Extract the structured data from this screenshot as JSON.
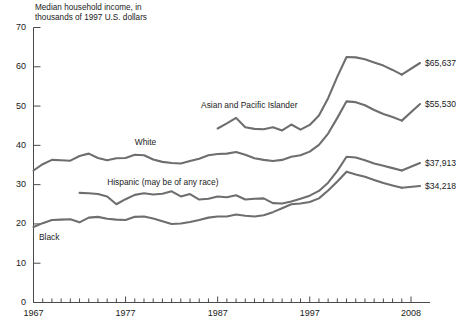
{
  "chart_data": {
    "type": "line",
    "title": "Median household income, in\nthousands of 1997 U.S. dollars",
    "xlabel": "",
    "ylabel": "",
    "xlim": [
      1967,
      2008
    ],
    "ylim": [
      0,
      70
    ],
    "yticks": [
      0,
      10,
      20,
      30,
      40,
      50,
      60,
      70
    ],
    "xticks_labeled": [
      1967,
      1977,
      1987,
      1997,
      2008
    ],
    "xtick_step": 1,
    "grid": false,
    "legend": "inline-labels",
    "x": [
      1967,
      1968,
      1969,
      1970,
      1971,
      1972,
      1973,
      1974,
      1975,
      1976,
      1977,
      1978,
      1979,
      1980,
      1981,
      1982,
      1983,
      1984,
      1985,
      1986,
      1987,
      1988,
      1989,
      1990,
      1991,
      1992,
      1993,
      1994,
      1995,
      1996,
      1997,
      1998,
      1999,
      2000,
      2001,
      2002,
      2003,
      2004,
      2005,
      2006,
      2007,
      2008
    ],
    "series": [
      {
        "name": "Asian and Pacific Islander",
        "label_x": 1987.2,
        "end_label": "$65,637",
        "x": [
          1987,
          1988,
          1989,
          1990,
          1991,
          1992,
          1993,
          1994,
          1995,
          1996,
          1997,
          1998,
          1999,
          2000,
          2001,
          2002,
          2003,
          2004,
          2005,
          2006,
          2007,
          2008
        ],
        "values": [
          44.3,
          45.6,
          47.0,
          44.6,
          44.2,
          44.1,
          44.6,
          43.8,
          45.3,
          44.0,
          45.2,
          47.6,
          52.0,
          57.5,
          62.5,
          62.4,
          61.9,
          61.1,
          60.3,
          59.2,
          58.0,
          65.637
        ]
      },
      {
        "name": "White",
        "label_x": 1978.5,
        "end_label": "$55,530",
        "x": [
          1967,
          1968,
          1969,
          1970,
          1971,
          1972,
          1973,
          1974,
          1975,
          1976,
          1977,
          1978,
          1979,
          1980,
          1981,
          1982,
          1983,
          1984,
          1985,
          1986,
          1987,
          1988,
          1989,
          1990,
          1991,
          1992,
          1993,
          1994,
          1995,
          1996,
          1997,
          1998,
          1999,
          2000,
          2001,
          2002,
          2003,
          2004,
          2005,
          2006,
          2007,
          2008
        ],
        "values": [
          33.6,
          35.2,
          36.3,
          36.2,
          36.1,
          37.3,
          37.9,
          36.8,
          36.2,
          36.7,
          36.8,
          37.6,
          37.5,
          36.4,
          35.8,
          35.5,
          35.4,
          36.0,
          36.6,
          37.5,
          37.8,
          37.9,
          38.3,
          37.6,
          36.7,
          36.3,
          36.0,
          36.3,
          37.1,
          37.5,
          38.4,
          40.1,
          43.0,
          47.0,
          51.2,
          51.0,
          50.2,
          49.0,
          48.0,
          47.2,
          46.3,
          55.53
        ]
      },
      {
        "name": "Hispanic (may be of any race)",
        "label_x": 1976.5,
        "end_label": "$37,913",
        "x": [
          1972,
          1973,
          1974,
          1975,
          1976,
          1977,
          1978,
          1979,
          1980,
          1981,
          1982,
          1983,
          1984,
          1985,
          1986,
          1987,
          1988,
          1989,
          1990,
          1991,
          1992,
          1993,
          1994,
          1995,
          1996,
          1997,
          1998,
          1999,
          2000,
          2001,
          2002,
          2003,
          2004,
          2005,
          2006,
          2007,
          2008
        ],
        "values": [
          27.9,
          27.8,
          27.6,
          27.0,
          25.0,
          26.3,
          27.4,
          27.8,
          27.5,
          27.7,
          28.3,
          27.0,
          27.6,
          26.2,
          26.4,
          27.0,
          26.8,
          27.3,
          26.2,
          26.4,
          26.5,
          25.3,
          25.2,
          25.7,
          26.4,
          27.2,
          28.4,
          30.5,
          33.5,
          37.1,
          36.9,
          36.2,
          35.4,
          34.8,
          34.2,
          33.6,
          37.913
        ]
      },
      {
        "name": "Black",
        "label_x": 1968.0,
        "end_label": "$34,218",
        "x": [
          1967,
          1968,
          1969,
          1970,
          1971,
          1972,
          1973,
          1974,
          1975,
          1976,
          1977,
          1978,
          1979,
          1980,
          1981,
          1982,
          1983,
          1984,
          1985,
          1986,
          1987,
          1988,
          1989,
          1990,
          1991,
          1992,
          1993,
          1994,
          1995,
          1996,
          1997,
          1998,
          1999,
          2000,
          2001,
          2002,
          2003,
          2004,
          2005,
          2006,
          2007,
          2008
        ],
        "values": [
          19.2,
          20.2,
          21.0,
          21.1,
          21.2,
          20.4,
          21.6,
          21.8,
          21.3,
          21.1,
          21.0,
          21.8,
          21.9,
          21.4,
          20.7,
          20.0,
          20.1,
          20.5,
          21.0,
          21.6,
          21.9,
          21.9,
          22.4,
          22.1,
          21.9,
          22.2,
          23.0,
          24.0,
          25.0,
          25.2,
          25.6,
          26.5,
          28.5,
          30.8,
          33.3,
          32.6,
          32.0,
          31.2,
          30.4,
          29.8,
          29.2,
          34.218
        ]
      }
    ],
    "annotations": [
      {
        "text": "Asian and Pacific Islander",
        "anchor": "series-asian"
      },
      {
        "text": "White",
        "anchor": "series-white"
      },
      {
        "text": "Hispanic (may be of any race)",
        "anchor": "series-hispanic"
      },
      {
        "text": "Black",
        "anchor": "series-black"
      }
    ],
    "end_labels": [
      "$65,637",
      "$55,530",
      "$37,913",
      "$34,218"
    ],
    "colors": {
      "line": "#6e6e6e",
      "axis": "#4a4a4a",
      "text": "#1a1a1a",
      "background": "#ffffff"
    }
  },
  "axis": {
    "y_ticks": [
      "0",
      "10",
      "20",
      "30",
      "40",
      "50",
      "60",
      "70"
    ],
    "x_ticks": [
      "1967",
      "1977",
      "1987",
      "1997",
      "2008"
    ]
  },
  "series_labels": {
    "asian": "Asian and Pacific Islander",
    "white": "White",
    "hispanic": "Hispanic (may be of any race)",
    "black": "Black"
  },
  "end_labels": {
    "asian": "$65,637",
    "white": "$55,530",
    "hispanic": "$37,913",
    "black": "$34,218"
  },
  "title": "Median household income, in\nthousands of 1997 U.S. dollars"
}
